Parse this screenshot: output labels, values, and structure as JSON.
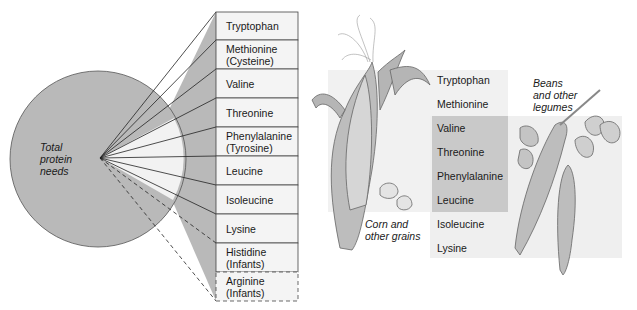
{
  "pie": {
    "label_lines": [
      "Total",
      "protein",
      "needs"
    ],
    "colors": {
      "fill": "#b9b9b9",
      "wedge": "#f2f2f2",
      "stroke": "#333333"
    }
  },
  "essential_table": {
    "rows": [
      {
        "label": "Tryptophan",
        "dashed": false
      },
      {
        "label": "Methionine\n(Cysteine)",
        "dashed": false
      },
      {
        "label": "Valine",
        "dashed": false
      },
      {
        "label": "Threonine",
        "dashed": false
      },
      {
        "label": "Phenylalanine\n(Tyrosine)",
        "dashed": false
      },
      {
        "label": "Leucine",
        "dashed": false
      },
      {
        "label": "Isoleucine",
        "dashed": false
      },
      {
        "label": "Lysine",
        "dashed": false
      },
      {
        "label": "Histidine\n(Infants)",
        "dashed": false
      },
      {
        "label": "Arginine\n(Infants)",
        "dashed": true
      }
    ]
  },
  "complementary": {
    "corn_label": [
      "Corn and",
      "other grains"
    ],
    "legume_label": [
      "Beans",
      "and other",
      "legumes"
    ],
    "amino_acids": [
      "Tryptophan",
      "Methionine",
      "Valine",
      "Threonine",
      "Phenylalanine",
      "Leucine",
      "Isoleucine",
      "Lysine"
    ]
  }
}
